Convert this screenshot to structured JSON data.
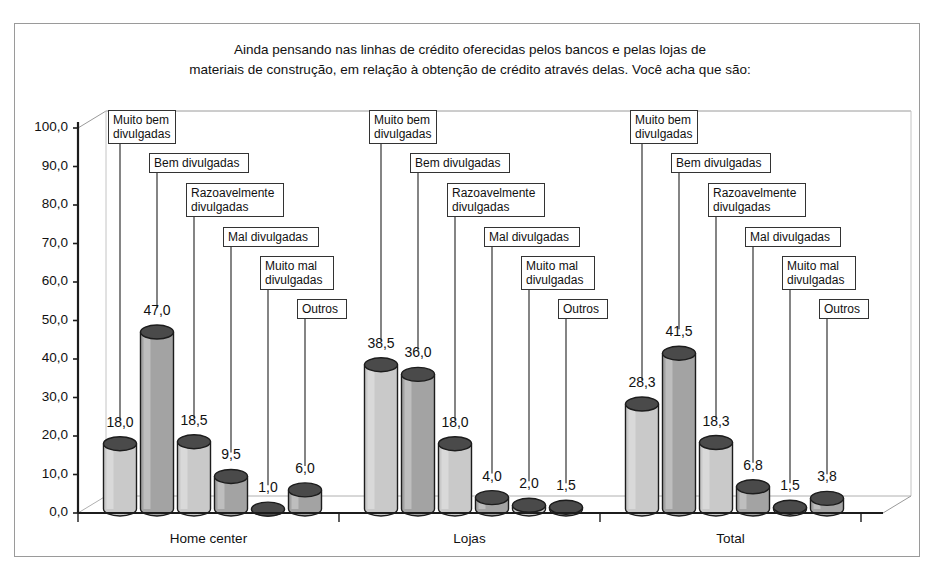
{
  "chart_data": {
    "type": "bar",
    "title": "Ainda pensando nas linhas de crédito oferecidas pelos bancos e pelas lojas de materiais de construção, em relação à obtenção de crédito através delas. Você acha que são:",
    "title_lines": [
      "Ainda pensando nas linhas de crédito oferecidas pelos bancos e pelas lojas de",
      "materiais de construção, em relação à obtenção de crédito através delas. Você acha que são:"
    ],
    "xlabel": "",
    "ylabel": "",
    "ylim": [
      0,
      100
    ],
    "grid": false,
    "legend_position": "callouts",
    "categories": [
      "Home center",
      "Lojas",
      "Total"
    ],
    "series": [
      {
        "name": "Muito bem divulgadas",
        "values": [
          18.0,
          38.5,
          28.3
        ],
        "labels": [
          "18,0",
          "38,5",
          "28,3"
        ]
      },
      {
        "name": "Bem divulgadas",
        "values": [
          47.0,
          36.0,
          41.5
        ],
        "labels": [
          "47,0",
          "36,0",
          "41,5"
        ]
      },
      {
        "name": "Razoavelmente divulgadas",
        "values": [
          18.5,
          18.0,
          18.3
        ],
        "labels": [
          "18,5",
          "18,0",
          "18,3"
        ]
      },
      {
        "name": "Mal divulgadas",
        "values": [
          9.5,
          4.0,
          6.8
        ],
        "labels": [
          "9,5",
          "4,0",
          "6,8"
        ]
      },
      {
        "name": "Muito mal divulgadas",
        "values": [
          1.0,
          2.0,
          1.5
        ],
        "labels": [
          "1,0",
          "2,0",
          "1,5"
        ]
      },
      {
        "name": "Outros",
        "values": [
          6.0,
          1.5,
          3.8
        ],
        "labels": [
          "6,0",
          "1,5",
          "3,8"
        ]
      }
    ],
    "ytick_labels": [
      "100,0",
      "90,0",
      "80,0",
      "70,0",
      "60,0",
      "50,0",
      "40,0",
      "30,0",
      "20,0",
      "10,0",
      "0,0"
    ],
    "ytick_values": [
      100,
      90,
      80,
      70,
      60,
      50,
      40,
      30,
      20,
      10,
      0
    ],
    "callout_labels": [
      "Muito bem\ndivulgadas",
      "Bem divulgadas",
      "Razoavelmente\ndivulgadas",
      "Mal divulgadas",
      "Muito mal\ndivulgadas",
      "Outros"
    ],
    "colors": {
      "bar_light": "#c9c9c9",
      "bar_medium": "#a3a3a3",
      "bar_top": "#4a4a4a",
      "bar_outline": "#1c1c1c",
      "axis": "#1c1c1c",
      "frame": "#9a9a9a",
      "wall": "#ffffff",
      "text": "#111111"
    }
  }
}
